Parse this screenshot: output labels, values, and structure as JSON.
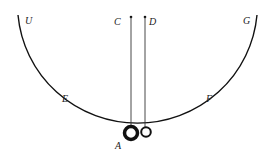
{
  "diagram": {
    "labels": {
      "U": "U",
      "G": "G",
      "C": "C",
      "D": "D",
      "E": "E",
      "F": "F",
      "A": "A"
    },
    "colors": {
      "line": "#111111",
      "background": "#ffffff"
    }
  }
}
